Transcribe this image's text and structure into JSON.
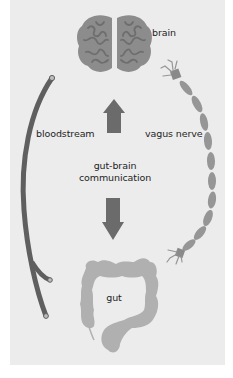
{
  "diagram": {
    "labels": {
      "brain": "brain",
      "bloodstream": "bloodstream",
      "vagus_nerve": "vagus nerve",
      "center_line1": "gut-brain",
      "center_line2": "communication",
      "gut": "gut"
    },
    "nodes": [
      {
        "id": "brain",
        "label": "brain",
        "icon": "brain-icon"
      },
      {
        "id": "gut",
        "label": "gut",
        "icon": "intestine-icon"
      }
    ],
    "edges": [
      {
        "from": "gut",
        "to": "brain",
        "via": "bloodstream",
        "icon": "blood-vessel-icon"
      },
      {
        "from": "gut",
        "to": "brain",
        "via": "vagus nerve",
        "icon": "nerve-icon"
      },
      {
        "from": "gut",
        "to": "brain",
        "icon": "arrow-up-icon"
      },
      {
        "from": "brain",
        "to": "gut",
        "icon": "arrow-down-icon"
      }
    ],
    "colors": {
      "background": "#ececec",
      "brain": "#8c8c8c",
      "brain_folds": "#6e6e6e",
      "vessel": "#5f5f5f",
      "nerve": "#969696",
      "arrows": "#6b6b6b",
      "gut": "#b0b0b0",
      "text": "#1e1e1e"
    }
  }
}
